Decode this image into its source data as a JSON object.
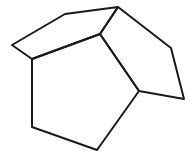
{
  "diagram": {
    "type": "polyhedral-net",
    "stroke_color": "#1a1a1a",
    "background": "#ffffff",
    "vertices": {
      "A": [
        12,
        45
      ],
      "B": [
        65,
        14
      ],
      "C": [
        118,
        7
      ],
      "D": [
        100,
        34
      ],
      "E": [
        32,
        59
      ],
      "F": [
        171,
        48
      ],
      "G": [
        184,
        99
      ],
      "H": [
        139,
        91
      ],
      "I": [
        97,
        150
      ],
      "J": [
        32,
        127
      ]
    },
    "faces": [
      {
        "name": "top-left-pentagon",
        "vertices": [
          "A",
          "B",
          "C",
          "D",
          "E"
        ]
      },
      {
        "name": "right-pentagon",
        "vertices": [
          "C",
          "F",
          "G",
          "H",
          "D"
        ]
      },
      {
        "name": "bottom-pentagon",
        "vertices": [
          "E",
          "D",
          "H",
          "I",
          "J"
        ]
      }
    ]
  }
}
